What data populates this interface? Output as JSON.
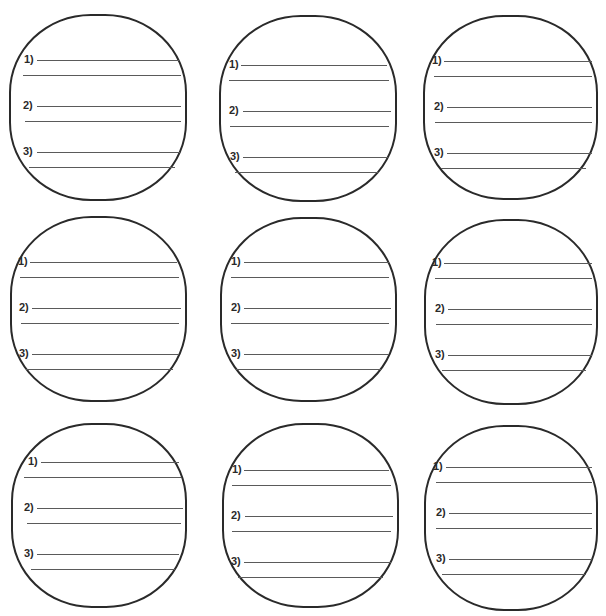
{
  "worksheet": {
    "cards": [
      {
        "items": [
          {
            "label": "1)"
          },
          {
            "label": "2)"
          },
          {
            "label": "3)"
          }
        ]
      },
      {
        "items": [
          {
            "label": "1)"
          },
          {
            "label": "2)"
          },
          {
            "label": "3)"
          }
        ]
      },
      {
        "items": [
          {
            "label": "1)"
          },
          {
            "label": "2)"
          },
          {
            "label": "3)"
          }
        ]
      },
      {
        "items": [
          {
            "label": "1)"
          },
          {
            "label": "2)"
          },
          {
            "label": "3)"
          }
        ]
      },
      {
        "items": [
          {
            "label": "1)"
          },
          {
            "label": "2)"
          },
          {
            "label": "3)"
          }
        ]
      },
      {
        "items": [
          {
            "label": "1)"
          },
          {
            "label": "2)"
          },
          {
            "label": "3)"
          }
        ]
      },
      {
        "items": [
          {
            "label": "1)"
          },
          {
            "label": "2)"
          },
          {
            "label": "3)"
          }
        ]
      },
      {
        "items": [
          {
            "label": "1)"
          },
          {
            "label": "2)"
          },
          {
            "label": "3)"
          }
        ]
      },
      {
        "items": [
          {
            "label": "1)"
          },
          {
            "label": "2)"
          },
          {
            "label": "3)"
          }
        ]
      }
    ],
    "colors": {
      "outline": "#2a2a2a",
      "writing_line": "#5a5a5a",
      "background": "#ffffff"
    }
  }
}
